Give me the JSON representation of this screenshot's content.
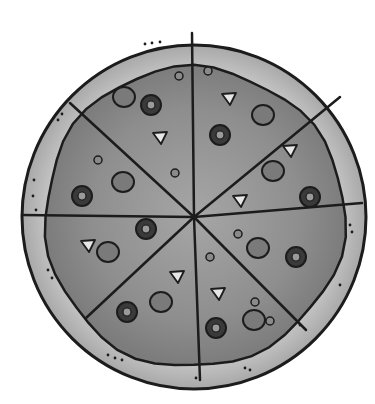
{
  "image": {
    "subject": "pizza",
    "style": "grayscale clipart",
    "slices": 8,
    "colors": {
      "background": "#ffffff",
      "crust": "#a8a8a8",
      "crust_highlight": "#c4c4c4",
      "sauce": "#8e8e8e",
      "sauce_light": "#a6a6a6",
      "outline": "#1c1c1c",
      "pepperoni": "#7a7a7a",
      "olive": "#3a3a3a",
      "onion": "#e6e6e6"
    },
    "center": [
      194,
      217
    ],
    "crust_radius": 172,
    "sauce_radius": 150,
    "cut_endpoints": [
      [
        192,
        33
      ],
      [
        340,
        97
      ],
      [
        362,
        203
      ],
      [
        306,
        330
      ],
      [
        200,
        380
      ],
      [
        86,
        318
      ],
      [
        22,
        215
      ],
      [
        70,
        103
      ]
    ],
    "pepperoni": [
      [
        124,
        97
      ],
      [
        263,
        115
      ],
      [
        123,
        182
      ],
      [
        273,
        171
      ],
      [
        108,
        252
      ],
      [
        258,
        248
      ],
      [
        161,
        302
      ],
      [
        254,
        320
      ]
    ],
    "olives": [
      [
        151,
        105
      ],
      [
        220,
        135
      ],
      [
        82,
        196
      ],
      [
        310,
        197
      ],
      [
        146,
        229
      ],
      [
        296,
        257
      ],
      [
        127,
        312
      ],
      [
        216,
        328
      ]
    ],
    "onions": [
      [
        160,
        137
      ],
      [
        229,
        98
      ],
      [
        290,
        150
      ],
      [
        240,
        200
      ],
      [
        88,
        245
      ],
      [
        177,
        276
      ],
      [
        218,
        293
      ]
    ],
    "small_bits": [
      [
        179,
        76
      ],
      [
        208,
        71
      ],
      [
        98,
        160
      ],
      [
        175,
        173
      ],
      [
        238,
        234
      ],
      [
        210,
        257
      ],
      [
        255,
        302
      ],
      [
        270,
        321
      ]
    ]
  }
}
